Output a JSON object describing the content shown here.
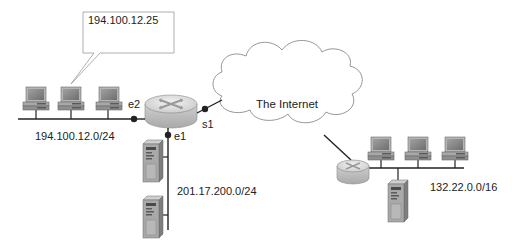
{
  "callout": {
    "text": "194.100.12.25"
  },
  "cloud": {
    "label": "The Internet"
  },
  "router_left": {
    "interfaces": {
      "e2": "e2",
      "e1": "e1",
      "s1": "s1"
    }
  },
  "networks": {
    "left_lan": "194.100.12.0/24",
    "server_lan": "201.17.200.0/24",
    "right_lan": "132.22.0.0/16"
  },
  "colors": {
    "line": "#222222",
    "cloud_stroke": "#8a8a8a",
    "router_top": "#d9d9d9",
    "router_side": "#bdbdbd",
    "device_gray": "#9a9a9a",
    "screen": "#7d7d7d"
  }
}
